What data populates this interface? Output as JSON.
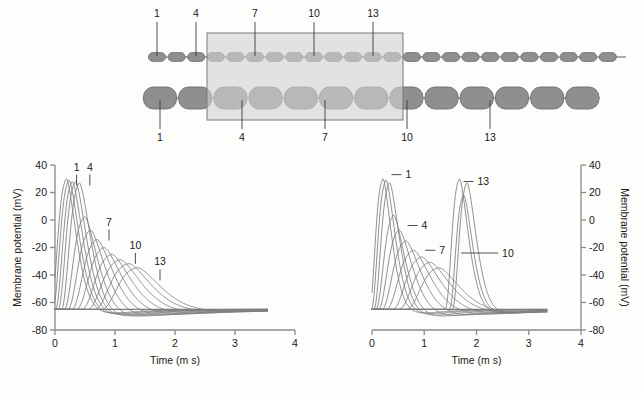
{
  "figure": {
    "name": "action-potential-propagation-figure",
    "diagram": {
      "name": "axon-diagram",
      "top_labels": [
        "1",
        "4",
        "7",
        "10",
        "13"
      ],
      "bottom_labels": [
        "1",
        "4",
        "7",
        "10",
        "13"
      ],
      "top_axon_name": "thin-axon-small-internodes",
      "bottom_axon_name": "thick-axon-large-internodes",
      "highlight_region_name": "demyelinated-region-shading",
      "colors": {
        "node_fill": "#8f8f8f",
        "node_stroke": "#6e6e6e",
        "axon_line": "#8f8f8f",
        "shade_fill": "#d2d2d2",
        "shade_stroke": "#7a7a7a"
      }
    },
    "charts": [
      {
        "name": "left-chart",
        "chart_ref": 0
      },
      {
        "name": "right-chart",
        "chart_ref": 1
      }
    ]
  },
  "chart_data": [
    {
      "type": "line",
      "name": "left-chart",
      "title": "",
      "xlabel": "Time (m s)",
      "ylabel": "Membrane potential (mV)",
      "xlim": [
        0,
        4
      ],
      "ylim": [
        -80,
        40
      ],
      "xticks": [
        0,
        1,
        2,
        3,
        4
      ],
      "xticklabels": [
        "0",
        "1",
        "2",
        "3",
        "4"
      ],
      "yticks": [
        -80,
        -60,
        -40,
        -20,
        0,
        20,
        40
      ],
      "yticklabels": [
        "-80",
        "-60",
        "-40",
        "-20",
        "0",
        "20",
        "40"
      ],
      "grid": false,
      "legend": "none",
      "y_axis_side": "left",
      "resting_potential": -65,
      "annotations": [
        {
          "label": "1",
          "x": 0.36,
          "y": 36
        },
        {
          "label": "4",
          "x": 0.58,
          "y": 36
        },
        {
          "label": "7",
          "x": 0.9,
          "y": -4
        },
        {
          "label": "10",
          "x": 1.34,
          "y": -21
        },
        {
          "label": "13",
          "x": 1.75,
          "y": -33
        }
      ],
      "series": [
        {
          "name": "node 1",
          "peak_time": 0.33,
          "peak_mv": 32,
          "width": 0.26,
          "undershoot_mv": -70
        },
        {
          "name": "node 2",
          "peak_time": 0.38,
          "peak_mv": 31,
          "width": 0.27,
          "undershoot_mv": -71
        },
        {
          "name": "node 3",
          "peak_time": 0.44,
          "peak_mv": 30,
          "width": 0.28,
          "undershoot_mv": -72
        },
        {
          "name": "node 4",
          "peak_time": 0.5,
          "peak_mv": 30,
          "width": 0.29,
          "undershoot_mv": -73
        },
        {
          "name": "node 5",
          "peak_time": 0.57,
          "peak_mv": 29,
          "width": 0.3,
          "undershoot_mv": -74
        },
        {
          "name": "node 6",
          "peak_time": 0.68,
          "peak_mv": 4,
          "width": 0.34,
          "undershoot_mv": -74
        },
        {
          "name": "node 7",
          "peak_time": 0.8,
          "peak_mv": -6,
          "width": 0.38,
          "undershoot_mv": -73
        },
        {
          "name": "node 8",
          "peak_time": 0.93,
          "peak_mv": -13,
          "width": 0.42,
          "undershoot_mv": -72
        },
        {
          "name": "node 9",
          "peak_time": 1.07,
          "peak_mv": -19,
          "width": 0.46,
          "undershoot_mv": -71
        },
        {
          "name": "node 10",
          "peak_time": 1.22,
          "peak_mv": -24,
          "width": 0.5,
          "undershoot_mv": -70
        },
        {
          "name": "node 11",
          "peak_time": 1.38,
          "peak_mv": -28,
          "width": 0.54,
          "undershoot_mv": -69
        },
        {
          "name": "node 12",
          "peak_time": 1.54,
          "peak_mv": -31,
          "width": 0.57,
          "undershoot_mv": -68
        },
        {
          "name": "node 13",
          "peak_time": 1.7,
          "peak_mv": -34,
          "width": 0.6,
          "undershoot_mv": -68
        }
      ]
    },
    {
      "type": "line",
      "name": "right-chart",
      "title": "",
      "xlabel": "Time (m s)",
      "ylabel": "Membrane potential (mV)",
      "xlim": [
        0,
        4
      ],
      "ylim": [
        -80,
        40
      ],
      "xticks": [
        0,
        1,
        2,
        3,
        4
      ],
      "xticklabels": [
        "0",
        "1",
        "2",
        "3",
        "4"
      ],
      "yticks": [
        -80,
        -60,
        -40,
        -20,
        0,
        20,
        40
      ],
      "yticklabels": [
        "-80",
        "-60",
        "-40",
        "-20",
        "0",
        "20",
        "40"
      ],
      "grid": false,
      "legend": "none",
      "y_axis_side": "right",
      "resting_potential": -65,
      "annotations": [
        {
          "label": "1",
          "x": 0.62,
          "y": 33
        },
        {
          "label": "4",
          "x": 0.93,
          "y": -4
        },
        {
          "label": "7",
          "x": 1.27,
          "y": -22
        },
        {
          "label": "10",
          "x": 2.47,
          "y": -24
        },
        {
          "label": "13",
          "x": 2.0,
          "y": 28
        }
      ],
      "series": [
        {
          "name": "node 1",
          "peak_time": 0.35,
          "peak_mv": 32,
          "width": 0.26,
          "undershoot_mv": -70
        },
        {
          "name": "node 2",
          "peak_time": 0.42,
          "peak_mv": 31,
          "width": 0.28,
          "undershoot_mv": -71
        },
        {
          "name": "node 3",
          "peak_time": 0.5,
          "peak_mv": 29,
          "width": 0.3,
          "undershoot_mv": -73
        },
        {
          "name": "node 4",
          "peak_time": 0.6,
          "peak_mv": 5,
          "width": 0.34,
          "undershoot_mv": -74
        },
        {
          "name": "node 5",
          "peak_time": 0.74,
          "peak_mv": -6,
          "width": 0.4,
          "undershoot_mv": -73
        },
        {
          "name": "node 6",
          "peak_time": 0.9,
          "peak_mv": -14,
          "width": 0.46,
          "undershoot_mv": -72
        },
        {
          "name": "node 7",
          "peak_time": 1.08,
          "peak_mv": -21,
          "width": 0.52,
          "undershoot_mv": -71
        },
        {
          "name": "node 8",
          "peak_time": 1.26,
          "peak_mv": -26,
          "width": 0.56,
          "undershoot_mv": -70
        },
        {
          "name": "node 9",
          "peak_time": 1.44,
          "peak_mv": -30,
          "width": 0.6,
          "undershoot_mv": -69
        },
        {
          "name": "node 10",
          "peak_time": 1.62,
          "peak_mv": -34,
          "width": 0.62,
          "undershoot_mv": -69
        },
        {
          "name": "node 11",
          "peak_time": 1.82,
          "peak_mv": 32,
          "width": 0.27,
          "undershoot_mv": -70
        },
        {
          "name": "node 12",
          "peak_time": 1.9,
          "peak_mv": 20,
          "width": 0.27,
          "undershoot_mv": -70
        },
        {
          "name": "node 13",
          "peak_time": 1.97,
          "peak_mv": 29,
          "width": 0.28,
          "undershoot_mv": -70
        }
      ]
    }
  ]
}
